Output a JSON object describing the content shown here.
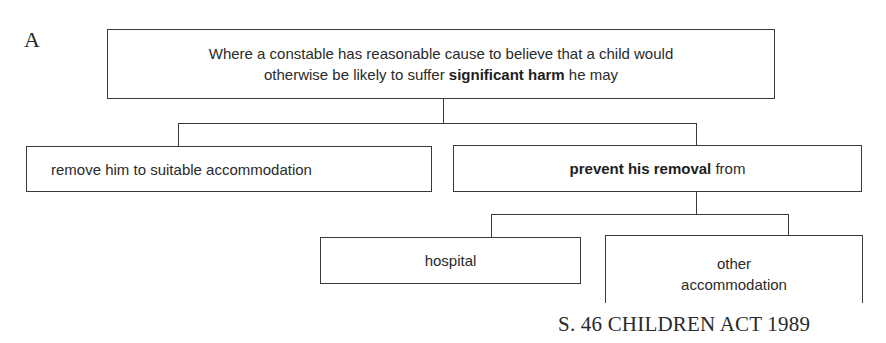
{
  "figure": {
    "panel_label": "A",
    "caption": "S. 46 CHILDREN ACT 1989"
  },
  "nodes": {
    "root": {
      "line1": "Where a constable has reasonable cause to believe that a child would",
      "line2_prefix": "otherwise be likely to suffer ",
      "line2_bold": "significant harm",
      "line2_suffix": " he may"
    },
    "remove": {
      "label": "remove him to suitable accommodation"
    },
    "prevent": {
      "bold": "prevent his removal",
      "suffix": " from"
    },
    "hospital": {
      "label": "hospital"
    },
    "other": {
      "line1": "other",
      "line2": "accommodation"
    }
  },
  "edges": [
    {
      "from": "root",
      "to": "remove"
    },
    {
      "from": "root",
      "to": "prevent"
    },
    {
      "from": "prevent",
      "to": "hospital"
    },
    {
      "from": "prevent",
      "to": "other"
    }
  ],
  "colors": {
    "line": "#3a3a3a",
    "text": "#2a2a2a",
    "background": "#ffffff"
  }
}
